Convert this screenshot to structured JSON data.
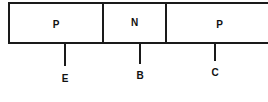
{
  "diagram": {
    "regions": [
      {
        "label": "P",
        "terminal": "E"
      },
      {
        "label": "N",
        "terminal": "B"
      },
      {
        "label": "P",
        "terminal": "C"
      }
    ],
    "line_color": "#1a1a1a"
  }
}
